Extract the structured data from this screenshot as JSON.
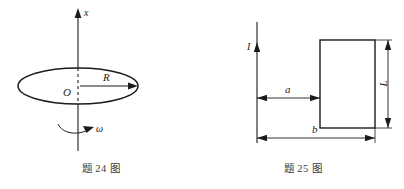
{
  "page": {
    "background_color": "#ffffff",
    "ink_color": "#1c1c1c",
    "caption_color": "#3a3a3a",
    "width": 404,
    "height": 189
  },
  "figures": [
    {
      "id": "figure-24",
      "caption": "题 24 图",
      "description": "ring of radius R rotating about a vertical x-axis with angular velocity omega",
      "labels": {
        "axis": "x",
        "origin": "O",
        "radius": "R",
        "angular_velocity": "ω"
      }
    },
    {
      "id": "figure-25",
      "caption": "题 25 图",
      "description": "long straight wire carrying current I beside a rectangular loop of height L, near edge at distance a, far edge at distance b",
      "labels": {
        "current": "I",
        "near_distance": "a",
        "far_distance": "b",
        "height": "L"
      }
    }
  ]
}
